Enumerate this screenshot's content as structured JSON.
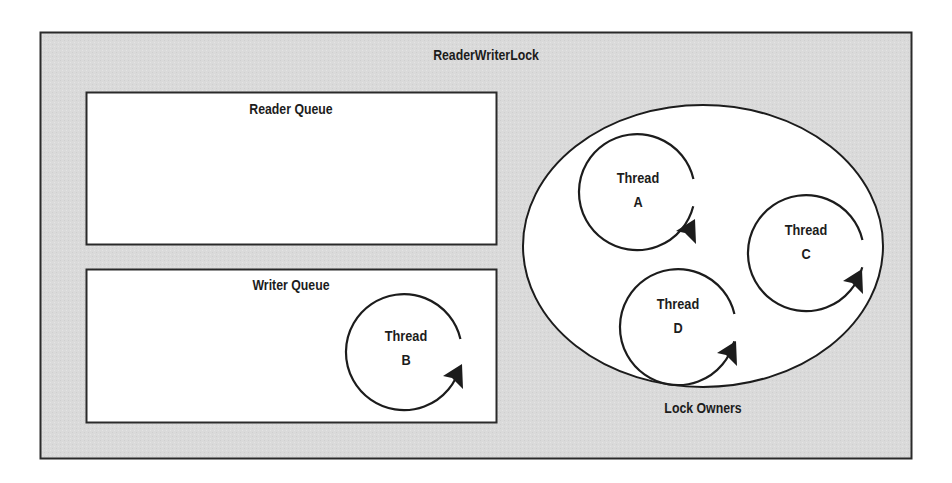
{
  "diagram": {
    "title": "ReaderWriterLock",
    "reader_queue": {
      "label": "Reader Queue",
      "threads": []
    },
    "writer_queue": {
      "label": "Writer Queue",
      "threads": [
        {
          "name": "Thread",
          "id": "B"
        }
      ]
    },
    "lock_owners": {
      "label": "Lock Owners",
      "threads": [
        {
          "name": "Thread",
          "id": "A"
        },
        {
          "name": "Thread",
          "id": "C"
        },
        {
          "name": "Thread",
          "id": "D"
        }
      ]
    },
    "colors": {
      "container_fill": "#d9d9d9",
      "box_fill": "#ffffff",
      "stroke": "#1c1c1c",
      "text": "#1c1c1c"
    }
  }
}
